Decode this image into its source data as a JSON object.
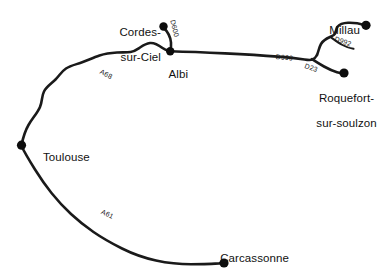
{
  "map": {
    "title": "Road map of the Tarn / Aveyron region",
    "background_color": "#ffffff",
    "road_color": "#1a1a1a",
    "city_dot_color": "#0d0d0d",
    "cities": [
      {
        "id": "cordes-sur-ciel",
        "label": "Cordes-\nsur-Ciel",
        "label_line1": "Cordes-",
        "label_line2": "sur-Ciel",
        "dot_x": 163,
        "dot_y": 26,
        "label_x": 101,
        "label_y": 14,
        "align": "align-right",
        "label_width": 60
      },
      {
        "id": "albi",
        "label": "Albi",
        "label_line1": "Albi",
        "label_line2": "",
        "dot_x": 170,
        "dot_y": 51,
        "label_x": 156,
        "label_y": 56,
        "align": "align-center",
        "label_width": 30
      },
      {
        "id": "toulouse",
        "label": "Toulouse",
        "label_line1": "Toulouse",
        "label_line2": "",
        "dot_x": 21,
        "dot_y": 145,
        "label_x": 31,
        "label_y": 138,
        "align": "align-center",
        "label_width": 56
      },
      {
        "id": "carcassonne",
        "label": "Carcassonne",
        "label_line1": "Carcassonne",
        "label_line2": "",
        "dot_x": 224,
        "dot_y": 263,
        "label_x": 208,
        "label_y": 240,
        "align": "align-center",
        "label_width": 80
      },
      {
        "id": "millau",
        "label": "Millau",
        "label_line1": "Millau",
        "label_line2": "",
        "dot_x": 366,
        "dot_y": 25,
        "label_x": 317,
        "label_y": 12,
        "align": "align-center",
        "label_width": 42
      },
      {
        "id": "roquefort-sur-soulzon",
        "label": "Roquefort-\nsur-soulzon",
        "label_line1": "Roquefort-",
        "label_line2": "sur-soulzon",
        "dot_x": 344,
        "dot_y": 73,
        "label_x": 294,
        "label_y": 79,
        "align": "align-center",
        "label_width": 94
      }
    ],
    "roads": [
      {
        "id": "d600",
        "label": "D600",
        "label_x": 176,
        "label_y": 19,
        "rotation": 76,
        "from": "albi",
        "to": "cordes-sur-ciel"
      },
      {
        "id": "a68",
        "label": "A68",
        "label_x": 102,
        "label_y": 68,
        "rotation": 27,
        "from": "toulouse",
        "to": "albi"
      },
      {
        "id": "a61",
        "label": "A61",
        "label_x": 103,
        "label_y": 208,
        "rotation": 25,
        "from": "toulouse",
        "to": "carcassonne"
      },
      {
        "id": "d999",
        "label": "D999",
        "label_x": 276,
        "label_y": 54,
        "rotation": 5,
        "from": "albi",
        "to": "junction"
      },
      {
        "id": "d992",
        "label": "D992",
        "label_x": 336,
        "label_y": 35,
        "rotation": 18,
        "from": "junction",
        "to": "millau"
      },
      {
        "id": "d23",
        "label": "D23",
        "label_x": 306,
        "label_y": 63,
        "rotation": 18,
        "from": "junction",
        "to": "roquefort-sur-soulzon"
      }
    ]
  }
}
